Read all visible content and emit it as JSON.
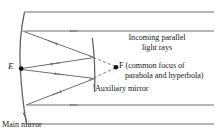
{
  "figure": {
    "labels": {
      "point_e": "E",
      "point_f": "F",
      "incoming_rays_line1": "Incoming parallel",
      "incoming_rays_line2": "light rays",
      "focus_line1": " (common focus of",
      "focus_line2": "parabola and hyperbola)",
      "auxiliary_mirror": "Auxiliary mirror",
      "main_mirror": "Main mirror"
    },
    "colors": {
      "stroke": "#666666",
      "stroke_dark": "#4d4d4d",
      "text": "#1a1a1a",
      "background": "#ffffff"
    },
    "geometry": {
      "main_mirror_top": [
        24,
        12
      ],
      "main_mirror_vertex": [
        20,
        68
      ],
      "main_mirror_bottom": [
        26,
        124
      ],
      "auxiliary_mirror_top": [
        93,
        38
      ],
      "auxiliary_mirror_bottom": [
        95,
        92
      ],
      "focus_point": [
        116,
        67
      ],
      "eye_point": [
        21,
        68
      ],
      "ray_top_y": 31,
      "ray_bottom_y": 105,
      "ray_right_edge": 214
    }
  }
}
